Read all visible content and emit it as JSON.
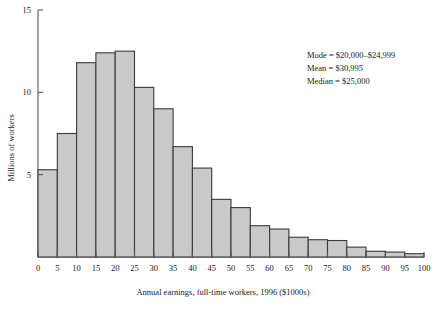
{
  "figure": {
    "background_color": "#ffffff",
    "bar_fill_color": "#c9c9c9",
    "bar_edge_color": "#3a3a3a",
    "axis_color": "#555555",
    "text_color": "#1a1a1a"
  },
  "annotations": {
    "mode": "Mode = $20,000–$24,999",
    "mean": "Mean = $30,995",
    "median": "Median = $25,000"
  },
  "chart_data": {
    "type": "bar",
    "title": "",
    "xlabel": "Annual earnings, full-time workers, 1996 ($1000s)",
    "ylabel": "Millions of workers",
    "xlim": [
      0,
      100
    ],
    "ylim": [
      0,
      15
    ],
    "xticks": [
      0,
      5,
      10,
      15,
      20,
      25,
      30,
      35,
      40,
      45,
      50,
      55,
      60,
      65,
      70,
      75,
      80,
      85,
      90,
      95,
      100
    ],
    "xtick_labels": [
      "0",
      "5",
      "10",
      "15",
      "20",
      "25",
      "30",
      "35",
      "40",
      "45",
      "50",
      "55",
      "60",
      "65",
      "70",
      "75",
      "80",
      "85",
      "90",
      "95",
      "100"
    ],
    "yticks": [
      5,
      10,
      15
    ],
    "ytick_labels": [
      "5",
      "10",
      "15"
    ],
    "grid": false,
    "legend": false,
    "bin_width": 5,
    "bin_edges": [
      0,
      5,
      10,
      15,
      20,
      25,
      30,
      35,
      40,
      45,
      50,
      55,
      60,
      65,
      70,
      75,
      80,
      85,
      90,
      95,
      100
    ],
    "categories": [
      "0–5",
      "5–10",
      "10–15",
      "15–20",
      "20–25",
      "25–30",
      "30–35",
      "35–40",
      "40–45",
      "45–50",
      "50–55",
      "55–60",
      "60–65",
      "65–70",
      "70–75",
      "75–80",
      "80–85",
      "85–90",
      "90–95",
      "95–100"
    ],
    "values": [
      5.3,
      7.5,
      11.8,
      12.4,
      12.5,
      10.3,
      9.0,
      6.7,
      5.4,
      3.5,
      3.0,
      1.9,
      1.7,
      1.2,
      1.05,
      1.0,
      0.6,
      0.35,
      0.3,
      0.2
    ]
  }
}
